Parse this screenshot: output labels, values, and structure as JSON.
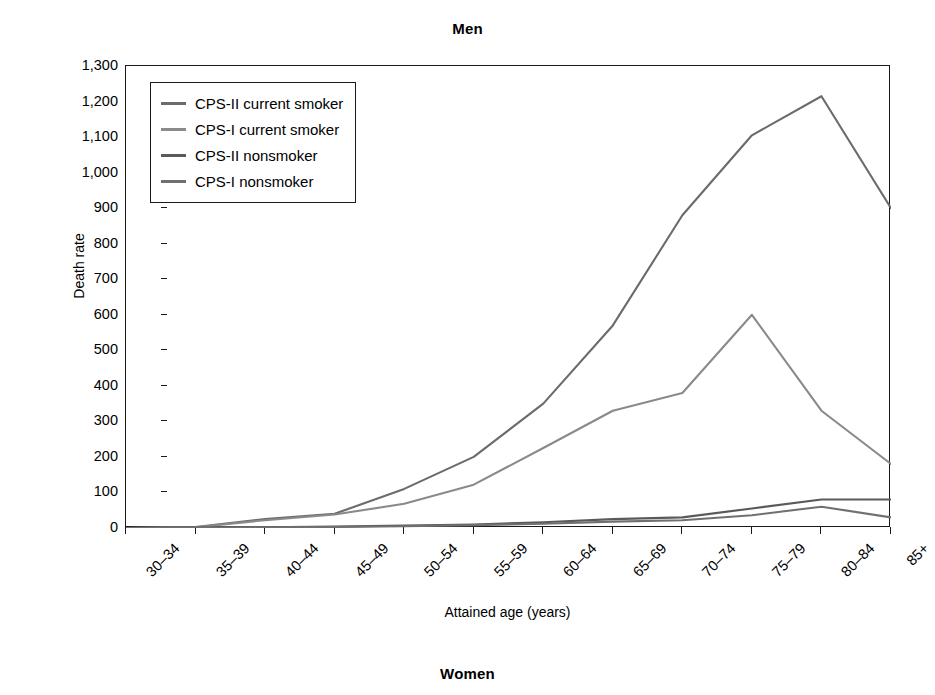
{
  "figure": {
    "panel_title_men": "Men",
    "panel_title_women": "Women"
  },
  "axes": {
    "ylabel": "Death rate",
    "xlabel": "Attained age (years)",
    "ytick_labels": [
      "0",
      "100",
      "200",
      "300",
      "400",
      "500",
      "600",
      "700",
      "800",
      "900",
      "1,000",
      "1,100",
      "1,200",
      "1,300"
    ],
    "xtick_labels": [
      "30–34",
      "35–39",
      "40–44",
      "45–49",
      "50–54",
      "55–59",
      "60–64",
      "65–69",
      "70–74",
      "75–79",
      "80–84",
      "85+"
    ]
  },
  "legend": {
    "items": [
      {
        "label": "CPS-II current smoker",
        "color": "#6b6b6b"
      },
      {
        "label": "CPS-I current smoker",
        "color": "#8a8a8a"
      },
      {
        "label": "CPS-II nonsmoker",
        "color": "#5a5a5a"
      },
      {
        "label": "CPS-I nonsmoker",
        "color": "#707070"
      }
    ]
  },
  "chart_data": {
    "type": "line",
    "title": "Men",
    "xlabel": "Attained age (years)",
    "ylabel": "Death rate",
    "categories": [
      "30–34",
      "35–39",
      "40–44",
      "45–49",
      "50–54",
      "55–59",
      "60–64",
      "65–69",
      "70–74",
      "75–79",
      "80–84",
      "85+"
    ],
    "ylim": [
      0,
      1300
    ],
    "ytick_step": 100,
    "grid": false,
    "legend_position": "upper-left",
    "series": [
      {
        "name": "CPS-II current smoker",
        "color": "#6b6b6b",
        "values": [
          0,
          3,
          25,
          40,
          110,
          200,
          350,
          570,
          880,
          1105,
          1215,
          900
        ]
      },
      {
        "name": "CPS-I current smoker",
        "color": "#8a8a8a",
        "values": [
          0,
          2,
          22,
          38,
          68,
          122,
          225,
          330,
          380,
          600,
          330,
          180
        ]
      },
      {
        "name": "CPS-II nonsmoker",
        "color": "#5a5a5a",
        "values": [
          0,
          1,
          2,
          4,
          7,
          10,
          16,
          25,
          30,
          55,
          80,
          80
        ]
      },
      {
        "name": "CPS-I nonsmoker",
        "color": "#707070",
        "values": [
          0,
          1,
          2,
          3,
          5,
          8,
          12,
          18,
          22,
          36,
          60,
          30
        ]
      }
    ]
  }
}
